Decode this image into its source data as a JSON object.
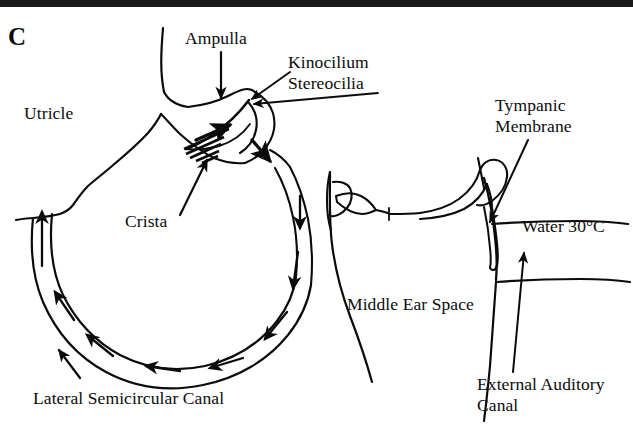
{
  "figure": {
    "panel_letter": "C",
    "ink_color": "#0b0b0b",
    "background_color": "#ffffff"
  },
  "labels": {
    "panel": "C",
    "utricle": "Utricle",
    "ampulla": "Ampulla",
    "kinocilium": "Kinocilium",
    "stereocilia": "Stereocilia",
    "crista": "Crista",
    "lateral_semicircular_canal": "Lateral Semicircular Canal",
    "tympanic_membrane_line1": "Tympanic",
    "tympanic_membrane_line2": "Membrane",
    "water_temperature": "Water 30°C",
    "middle_ear_space": "Middle Ear Space",
    "external_auditory_line1": "External Auditory",
    "external_auditory_line2": "Canal"
  },
  "structures": [
    {
      "name": "utricle",
      "kind": "chamber"
    },
    {
      "name": "ampulla",
      "kind": "chamber"
    },
    {
      "name": "crista-with-cupula",
      "kind": "sensory-organ"
    },
    {
      "name": "hair-cell-bundles",
      "kind": "cilia"
    },
    {
      "name": "lateral-semicircular-canal",
      "kind": "duct"
    },
    {
      "name": "endolymph-flow-arrows",
      "kind": "flow-indicator",
      "direction": "counterclockwise"
    },
    {
      "name": "stapes",
      "kind": "ossicle"
    },
    {
      "name": "incus",
      "kind": "ossicle"
    },
    {
      "name": "malleus",
      "kind": "ossicle"
    },
    {
      "name": "tympanic-membrane",
      "kind": "membrane"
    },
    {
      "name": "middle-ear-space",
      "kind": "cavity"
    },
    {
      "name": "external-auditory-canal",
      "kind": "cavity"
    }
  ]
}
